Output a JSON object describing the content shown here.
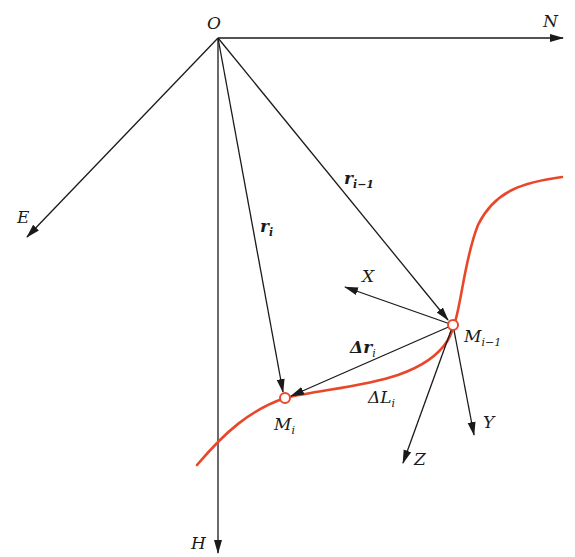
{
  "diagram": {
    "type": "coordinate-system-vector-diagram",
    "colors": {
      "line": "#1a1a1a",
      "curve": "#e8472a",
      "point_fill": "#ffffff"
    },
    "origin": {
      "label": "O",
      "x": 218,
      "y": 38
    },
    "global_axes": [
      {
        "id": "N",
        "label": "N",
        "from": [
          218,
          38
        ],
        "to": [
          563,
          38
        ]
      },
      {
        "id": "E",
        "label": "E",
        "from": [
          218,
          38
        ],
        "to": [
          27,
          237
        ]
      },
      {
        "id": "H",
        "label": "H",
        "from": [
          218,
          38
        ],
        "to": [
          218,
          553
        ]
      }
    ],
    "position_vectors": [
      {
        "id": "r_i",
        "label": "r",
        "subscript": "i",
        "from": [
          218,
          38
        ],
        "to": [
          285,
          398
        ]
      },
      {
        "id": "r_i-1",
        "label": "r",
        "subscript": "i−1",
        "from": [
          218,
          38
        ],
        "to": [
          453,
          325
        ]
      }
    ],
    "displacement_vector": {
      "id": "delta_r_i",
      "label": "Δr",
      "subscript": "i",
      "from": [
        453,
        325
      ],
      "to": [
        285,
        398
      ]
    },
    "points": [
      {
        "id": "M_i",
        "label": "M",
        "subscript": "i",
        "x": 285,
        "y": 398
      },
      {
        "id": "M_i-1",
        "label": "M",
        "subscript": "i−1",
        "x": 453,
        "y": 325
      }
    ],
    "local_axes": [
      {
        "id": "X",
        "label": "X",
        "from": [
          453,
          325
        ],
        "to": [
          345,
          287
        ]
      },
      {
        "id": "Y",
        "label": "Y",
        "from": [
          453,
          325
        ],
        "to": [
          474,
          435
        ]
      },
      {
        "id": "Z",
        "label": "Z",
        "from": [
          453,
          325
        ],
        "to": [
          403,
          463
        ]
      }
    ],
    "arc_length": {
      "id": "delta_L_i",
      "label": "ΔL",
      "subscript": "i"
    },
    "labels": {
      "O": "O",
      "N": "N",
      "E": "E",
      "H": "H",
      "X": "X",
      "Y": "Y",
      "Z": "Z",
      "r": "r",
      "i": "i",
      "i_minus_1": "i−1",
      "delta_r": "Δr",
      "delta_L": "ΔL",
      "M": "M"
    }
  }
}
